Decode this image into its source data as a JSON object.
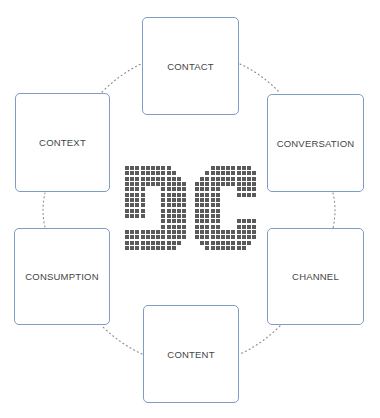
{
  "diagram": {
    "title_logo": "DC",
    "colors": {
      "box_border": "#7f9cc4",
      "label_text": "#444444",
      "connector": "#888888",
      "logo_dot": "#5a5a5a"
    },
    "nodes": [
      {
        "id": "contact",
        "label": "CONTACT",
        "x": 142,
        "y": 17,
        "w": 97,
        "h": 98
      },
      {
        "id": "conversation",
        "label": "CONVERSATION",
        "x": 267,
        "y": 94,
        "w": 97,
        "h": 98
      },
      {
        "id": "channel",
        "label": "CHANNEL",
        "x": 267,
        "y": 228,
        "w": 97,
        "h": 97
      },
      {
        "id": "content",
        "label": "CONTENT",
        "x": 143,
        "y": 305,
        "w": 96,
        "h": 98
      },
      {
        "id": "consumption",
        "label": "CONSUMPTION",
        "x": 14,
        "y": 228,
        "w": 96,
        "h": 97
      },
      {
        "id": "context",
        "label": "CONTEXT",
        "x": 15,
        "y": 93,
        "w": 95,
        "h": 99
      }
    ],
    "edges": [
      {
        "from": "contact",
        "to": "conversation",
        "style": "dotted"
      },
      {
        "from": "conversation",
        "to": "channel",
        "style": "dotted"
      },
      {
        "from": "channel",
        "to": "content",
        "style": "dotted"
      },
      {
        "from": "content",
        "to": "consumption",
        "style": "dotted"
      },
      {
        "from": "consumption",
        "to": "context",
        "style": "dotted"
      },
      {
        "from": "context",
        "to": "contact",
        "style": "dotted"
      }
    ],
    "logo_grid": {
      "rows": 16,
      "cols": 12,
      "D": [
        "111111111000",
        "111111111100",
        "111111111110",
        "111111111111",
        "111100011111",
        "111100011111",
        "111100011111",
        "111100011111",
        "111100011111",
        "111100011111",
        "000000011111",
        "000000011111",
        "111111111111",
        "111111111111",
        "111111111110",
        "111111111100"
      ],
      "C": [
        "000111111110",
        "001111111111",
        "011111111111",
        "111111111111",
        "111110001111",
        "111110001111",
        "111110000000",
        "111110000000",
        "111110000000",
        "111110000000",
        "111110001111",
        "111110001111",
        "111111111111",
        "111111111111",
        "011111111110",
        "001111111100"
      ]
    }
  }
}
